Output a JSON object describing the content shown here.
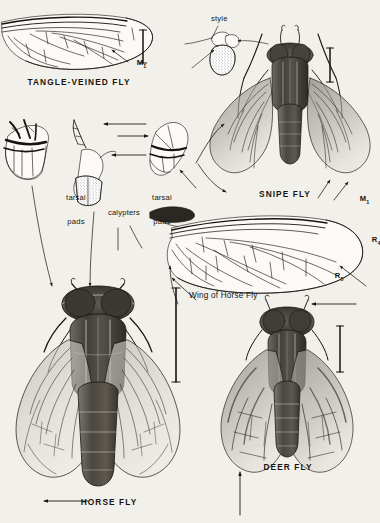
{
  "plate": {
    "title": "Horse Flies and Relatives plate",
    "background_color": "#f2f0eb",
    "ink_color": "#17140f",
    "width": 380,
    "height": 523
  },
  "figures": {
    "tangle_veined_fly": {
      "caption": "TANGLE-VEINED FLY",
      "vein_label": "M",
      "vein_sub": "1"
    },
    "style_detail": {
      "label": "style"
    },
    "snipe_fly": {
      "caption": "SNIPE FLY",
      "vein_label": "M",
      "vein_sub": "1"
    },
    "tarsal_pads_left": {
      "label_line1": "tarsal",
      "label_line2": "pads"
    },
    "tarsal_pads_right": {
      "label_line1": "tarsal",
      "label_line2": "pads"
    },
    "calypters": {
      "label": "calypters"
    },
    "horse_fly_wing": {
      "caption": "Wing of Horse Fly",
      "vein_r4_label": "R",
      "vein_r4_sub": "4",
      "vein_r5_label": "R",
      "vein_r5_sub": "5"
    },
    "horse_fly": {
      "caption": "HORSE FLY"
    },
    "deer_fly": {
      "caption": "DEER FLY"
    }
  }
}
